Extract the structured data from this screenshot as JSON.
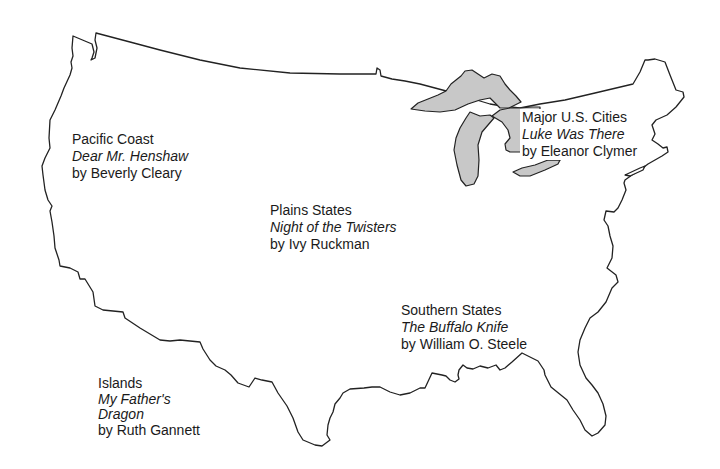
{
  "map": {
    "title": "United States reading map",
    "regions": [
      {
        "id": "pacific-coast",
        "region": "Pacific Coast",
        "book": "Dear Mr. Henshaw",
        "author": "by Beverly Cleary"
      },
      {
        "id": "plains-states",
        "region": "Plains States",
        "book": "Night of the Twisters",
        "author": "by Ivy Ruckman"
      },
      {
        "id": "major-cities",
        "region": "Major U.S. Cities",
        "book": "Luke Was There",
        "author": "by Eleanor Clymer"
      },
      {
        "id": "southern-states",
        "region": "Southern States",
        "book": "The Buffalo Knife",
        "author": "by William O. Steele"
      },
      {
        "id": "islands",
        "region": "Islands",
        "book": "My Father's Dragon",
        "author": "by Ruth Gannett"
      }
    ],
    "colors": {
      "outline": "#222222",
      "lakes": "#c8c8c8",
      "background": "#ffffff"
    }
  }
}
